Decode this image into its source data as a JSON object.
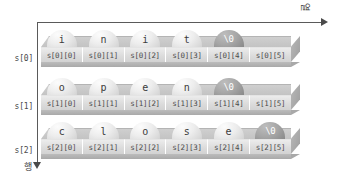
{
  "axes": {
    "column_axis_label": "열",
    "row_axis_label": "행"
  },
  "rows": [
    {
      "label": "s[0]",
      "chars": [
        "i",
        "n",
        "i",
        "t",
        "\\0",
        ""
      ],
      "indices": [
        "s[0][0]",
        "s[0][1]",
        "s[0][2]",
        "s[0][3]",
        "s[0][4]",
        "s[0][5]"
      ],
      "null_index": 4
    },
    {
      "label": "s[1]",
      "chars": [
        "o",
        "p",
        "e",
        "n",
        "\\0",
        ""
      ],
      "indices": [
        "s[1][0]",
        "s[1][1]",
        "s[1][2]",
        "s[1][3]",
        "s[1][4]",
        "s[1][5]"
      ],
      "null_index": 4
    },
    {
      "label": "s[2]",
      "chars": [
        "c",
        "l",
        "o",
        "s",
        "e",
        "\\0"
      ],
      "indices": [
        "s[2][0]",
        "s[2][1]",
        "s[2][2]",
        "s[2][3]",
        "s[2][4]",
        "s[2][5]"
      ],
      "null_index": 5
    }
  ],
  "colors": {
    "axis": "#5a5a5a",
    "cell_face": "#dcdcdc",
    "bubble_face": "#ededed",
    "null_bubble_face": "#a6a6a6",
    "text": "#4b4b4b",
    "null_text": "#ffffff",
    "block_side": "#a8a8a8"
  },
  "geometry": {
    "row_tops": [
      30,
      78,
      122
    ],
    "row_label_tops": [
      54,
      102,
      146
    ]
  }
}
